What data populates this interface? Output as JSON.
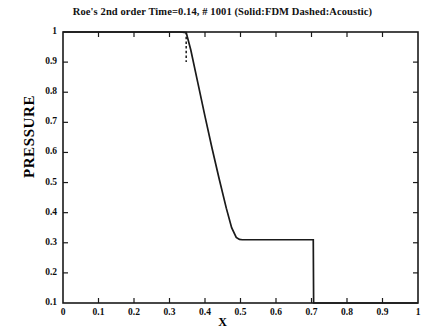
{
  "figure": {
    "title": "Roe's 2nd order Time=0.14, # 1001 (Solid:FDM  Dashed:Acoustic)",
    "background_color": "#ffffff",
    "frame_color": "#1a1a1a",
    "curve_color": "#1a1a1a"
  },
  "chart_data": {
    "type": "line",
    "title": "Roe's 2nd order Time=0.14, # 1001 (Solid:FDM  Dashed:Acoustic)",
    "xlabel": "X",
    "ylabel": "PRESSURE",
    "xlim": [
      0,
      1
    ],
    "ylim": [
      0.1,
      1
    ],
    "grid": false,
    "legend_position": "in-title",
    "xticks": [
      0,
      0.1,
      0.2,
      0.3,
      0.4,
      0.5,
      0.6,
      0.7,
      0.8,
      0.9,
      1
    ],
    "xtick_labels": [
      "0",
      "0.1",
      "0.2",
      "0.3",
      "0.4",
      "0.5",
      "0.6",
      "0.7",
      "0.8",
      "0.9",
      "1"
    ],
    "yticks": [
      0.1,
      0.2,
      0.3,
      0.4,
      0.5,
      0.6,
      0.7,
      0.8,
      0.9,
      1
    ],
    "ytick_labels": [
      "0.1",
      "0.2",
      "0.3",
      "0.4",
      "0.5",
      "0.6",
      "0.7",
      "0.8",
      "0.9",
      "1"
    ],
    "annotations": [
      "Solid line: FDM solution",
      "Dashed line: Acoustic solution",
      "Expansion fan between x=0.35 and x=0.50",
      "Contact plateau pressure = 0.31",
      "Shock discontinuity at x=0.705"
    ],
    "series": [
      {
        "name": "Solid:FDM",
        "style": "solid",
        "x": [
          0.0,
          0.05,
          0.1,
          0.15,
          0.2,
          0.25,
          0.3,
          0.33,
          0.347,
          0.36,
          0.38,
          0.4,
          0.42,
          0.44,
          0.46,
          0.475,
          0.488,
          0.497,
          0.505,
          0.54,
          0.58,
          0.62,
          0.66,
          0.69,
          0.703,
          0.705,
          0.706,
          0.74,
          0.8,
          0.86,
          0.92,
          0.96,
          1.0
        ],
        "y": [
          1.0,
          1.0,
          1.0,
          1.0,
          1.0,
          1.0,
          1.0,
          1.0,
          0.998,
          0.94,
          0.83,
          0.72,
          0.613,
          0.512,
          0.415,
          0.35,
          0.318,
          0.311,
          0.31,
          0.31,
          0.31,
          0.31,
          0.31,
          0.31,
          0.31,
          0.31,
          0.1,
          0.1,
          0.1,
          0.1,
          0.1,
          0.1,
          0.1
        ]
      },
      {
        "name": "Dashed:Acoustic",
        "style": "dashed",
        "x": [
          0.347,
          0.347,
          0.347,
          0.347
        ],
        "y": [
          1.0,
          0.965,
          0.93,
          0.9
        ]
      }
    ]
  },
  "ylabel_text": "PRESSURE",
  "xlabel_text": "X"
}
